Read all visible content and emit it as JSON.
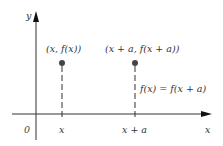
{
  "diagram": {
    "axes": {
      "x_label": "x",
      "y_label": "y",
      "origin_label": "0"
    },
    "ticks": [
      {
        "label": "x",
        "px": 62
      },
      {
        "label": "x + a",
        "px": 135
      }
    ],
    "points": [
      {
        "label": "(x, f(x))",
        "px": 62
      },
      {
        "label": "(x + a, f(x + a))",
        "px": 135
      }
    ],
    "equation": "f(x) = f(x + a)",
    "colors": {
      "axis": "#333333",
      "point": "#555555",
      "dash": "#555555"
    }
  }
}
